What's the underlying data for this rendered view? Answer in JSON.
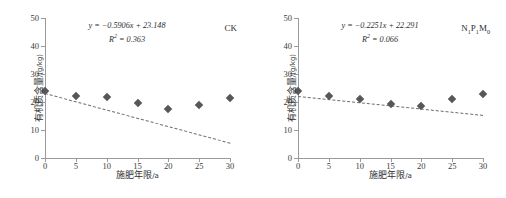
{
  "axes": {
    "x_title": "施肥年限",
    "x_unit": "/a",
    "y_title": "有机质含量",
    "y_unit": "/(g/kg)",
    "x_ticks": [
      "0",
      "5",
      "10",
      "15",
      "20",
      "25",
      "30"
    ],
    "y_ticks": [
      "0",
      "10",
      "20",
      "30",
      "40",
      "50"
    ]
  },
  "style": {
    "marker_color": "#575757",
    "axis_color": "#9a9a9a",
    "trend_color": "#6e6e6e"
  },
  "chart_data": [
    {
      "type": "scatter",
      "title": "CK",
      "xlabel": "施肥年限/a",
      "ylabel": "有机质含量/(g/kg)",
      "xlim": [
        0,
        30
      ],
      "ylim": [
        0,
        50
      ],
      "xticks": [
        0,
        5,
        10,
        15,
        20,
        25,
        30
      ],
      "yticks": [
        0,
        10,
        20,
        30,
        40,
        50
      ],
      "grid": false,
      "legend": "none",
      "x": [
        0,
        5,
        10,
        15,
        20,
        25,
        30
      ],
      "y": [
        23.8,
        22.0,
        21.8,
        19.5,
        17.5,
        19.1,
        21.5
      ],
      "equation": "y = −0.5906x + 23.148",
      "r_squared_label": "R",
      "r_squared_value": " = 0.363",
      "slope": -0.5906,
      "intercept": 23.148,
      "r_squared": 0.363,
      "trendline": "dashed"
    },
    {
      "type": "scatter",
      "title": "N₁P₁M₀",
      "title_base": [
        "N",
        "P",
        "M"
      ],
      "title_subs": [
        "1",
        "1",
        "0"
      ],
      "xlabel": "施肥年限/a",
      "ylabel": "有机质含量/(g/kg)",
      "xlim": [
        0,
        30
      ],
      "ylim": [
        0,
        50
      ],
      "xticks": [
        0,
        5,
        10,
        15,
        20,
        25,
        30
      ],
      "yticks": [
        0,
        10,
        20,
        30,
        40,
        50
      ],
      "grid": false,
      "legend": "none",
      "x": [
        0,
        5,
        10,
        15,
        20,
        25,
        30
      ],
      "y": [
        23.8,
        22.0,
        21.2,
        19.2,
        18.7,
        21.1,
        23.0
      ],
      "equation": "y = −0.2251x + 22.291",
      "r_squared_label": "R",
      "r_squared_value": " = 0.066",
      "slope": -0.2251,
      "intercept": 22.291,
      "r_squared": 0.066,
      "trendline": "dashed"
    }
  ]
}
